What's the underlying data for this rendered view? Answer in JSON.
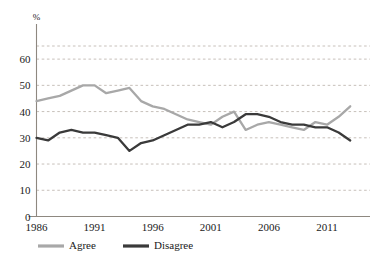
{
  "chart_data": {
    "type": "line",
    "title": "",
    "subtitle": "",
    "xlabel": "",
    "ylabel": "",
    "unit_label": "%",
    "xlim": [
      1986,
      2013
    ],
    "ylim": [
      0,
      65
    ],
    "yticks": [
      0,
      10,
      20,
      30,
      40,
      50,
      60
    ],
    "ytick_labels": [
      "0",
      "10",
      "20",
      "30",
      "40",
      "50",
      "60"
    ],
    "xticks": [
      1986,
      1991,
      1996,
      2001,
      2006,
      2011
    ],
    "xtick_labels": [
      "1986",
      "1991",
      "1996",
      "2001",
      "2006",
      "2011"
    ],
    "grid": "horizontal-dashed",
    "legend_position": "bottom-left",
    "x": [
      1986,
      1987,
      1988,
      1989,
      1990,
      1991,
      1992,
      1993,
      1994,
      1995,
      1996,
      1997,
      1998,
      1999,
      2000,
      2001,
      2002,
      2003,
      2004,
      2005,
      2006,
      2007,
      2008,
      2009,
      2010,
      2011,
      2012,
      2013
    ],
    "series": [
      {
        "name": "Agree",
        "color": "#a8a8a8",
        "values": [
          44,
          45,
          46,
          48,
          50,
          50,
          47,
          48,
          49,
          44,
          42,
          41,
          39,
          37,
          36,
          35,
          38,
          40,
          33,
          35,
          36,
          35,
          34,
          33,
          36,
          35,
          38,
          42
        ]
      },
      {
        "name": "Disagree",
        "color": "#3a3a3a",
        "values": [
          30,
          29,
          32,
          33,
          32,
          32,
          31,
          30,
          25,
          28,
          29,
          31,
          33,
          35,
          35,
          36,
          34,
          36,
          39,
          39,
          38,
          36,
          35,
          35,
          34,
          34,
          32,
          29
        ]
      }
    ],
    "legend": [
      {
        "label": "Agree",
        "color": "#a8a8a8"
      },
      {
        "label": "Disagree",
        "color": "#3a3a3a"
      }
    ]
  }
}
